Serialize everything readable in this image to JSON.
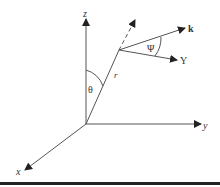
{
  "diagram": {
    "type": "spherical coordinate system",
    "axes": {
      "x": "x",
      "y": "y",
      "z": "z"
    },
    "vectors": {
      "position": "r",
      "wave_vector": "k",
      "Y": "Y"
    },
    "angles": {
      "polar": "θ",
      "psi": "Ψ"
    },
    "colors": {
      "line": "#555555",
      "text": "#333333",
      "bar": "#222222"
    }
  }
}
